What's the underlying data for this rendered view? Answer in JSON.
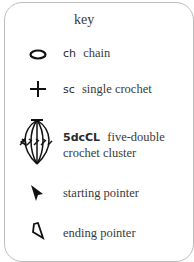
{
  "key": {
    "title": "key",
    "items": [
      {
        "symbol": "oval-icon",
        "abbr": "ch",
        "name": "chain"
      },
      {
        "symbol": "plus-icon",
        "abbr": "sc",
        "name": "single crochet"
      },
      {
        "symbol": "cluster-icon",
        "abbr": "5dcCL",
        "name": "five-double",
        "name2": "crochet cluster"
      },
      {
        "symbol": "filled-pointer-icon",
        "abbr": "",
        "name": "starting pointer"
      },
      {
        "symbol": "outline-pointer-icon",
        "abbr": "",
        "name": "ending pointer"
      }
    ]
  }
}
